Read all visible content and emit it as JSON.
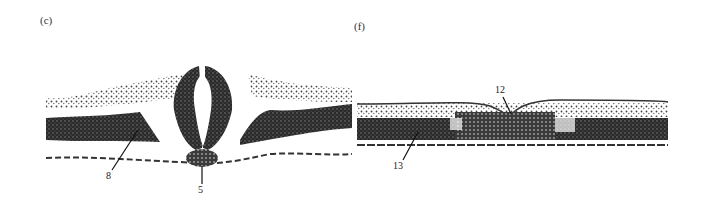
{
  "figure": {
    "panels": [
      {
        "id": "c",
        "label": "(c)",
        "callouts": [
          {
            "text": "8"
          },
          {
            "text": "5"
          }
        ]
      },
      {
        "id": "f",
        "label": "(f)",
        "callouts": [
          {
            "text": "12"
          },
          {
            "text": "13"
          }
        ]
      }
    ]
  },
  "colors": {
    "tissue_dark": "#1c1c1c",
    "tissue_mid": "#555555",
    "tissue_light": "#9a9a9a",
    "background": "#ffffff"
  }
}
